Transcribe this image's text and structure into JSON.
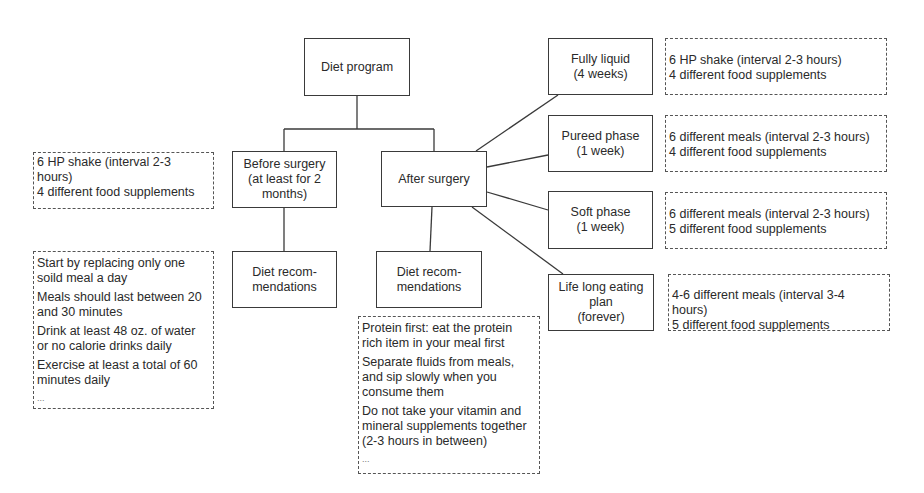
{
  "diagram": {
    "root": {
      "label": "Diet program"
    },
    "before": {
      "label": "Before surgery\n(at least for 2\nmonths)",
      "recommendations_label": "Diet recom-\nmendations",
      "regimen": [
        "6 HP shake (interval 2-3 hours)",
        "4 different food supplements"
      ],
      "recommendations": [
        "Start by replacing only one soild meal a day",
        "Meals should last between 20 and 30 minutes",
        "Drink at least 48 oz. of water or no calorie drinks daily",
        "Exercise at least a total of 60 minutes daily"
      ],
      "ellipsis": "..."
    },
    "after": {
      "label": "After surgery",
      "recommendations_label": "Diet recom-\nmendations",
      "recommendations": [
        "Protein first: eat the protein rich item in your meal first",
        "Separate fluids from meals, and sip slowly when you consume them",
        "Do not take your vitamin and mineral supplements together (2-3 hours in between)"
      ],
      "ellipsis": "...",
      "phases": [
        {
          "label": "Fully liquid\n(4 weeks)",
          "details": [
            "6 HP shake (interval 2-3 hours)",
            "4 different food supplements"
          ]
        },
        {
          "label": "Pureed phase\n(1 week)",
          "details": [
            "6 different meals (interval 2-3 hours)",
            "4 different food supplements"
          ]
        },
        {
          "label": "Soft phase\n(1 week)",
          "details": [
            "6 different meals (interval 2-3 hours)",
            "5 different food supplements"
          ]
        },
        {
          "label": "Life long eating\nplan\n(forever)",
          "details": [
            "4-6 different meals (interval 3-4 hours)",
            "5 different food supplements"
          ]
        }
      ]
    }
  }
}
